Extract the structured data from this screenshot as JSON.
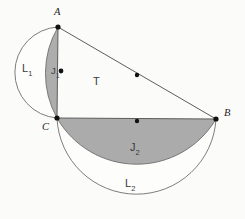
{
  "figure": {
    "background_color": "#fbfbfa",
    "stroke_color": "#6b6b6b",
    "lune_fill_color": "#a8a8a8",
    "point_color": "#111111"
  },
  "points": [
    {
      "id": "A",
      "label": "A",
      "x": 58,
      "y": 27
    },
    {
      "id": "B",
      "label": "B",
      "x": 216,
      "y": 119
    },
    {
      "id": "C",
      "label": "C",
      "x": 57,
      "y": 118
    }
  ],
  "midpoint_dots": [
    {
      "id": "midpoint-ab",
      "x": 137,
      "y": 75
    },
    {
      "id": "midpoint-cb",
      "x": 137,
      "y": 121
    },
    {
      "id": "midpoint-ac-lune",
      "x": 61,
      "y": 71
    }
  ],
  "regions": [
    {
      "id": "lune-upper-outer",
      "label": "L",
      "subscript": "1",
      "x": 22,
      "y": 63
    },
    {
      "id": "lune-upper-inner",
      "label": "J",
      "subscript": "1",
      "x": 51,
      "y": 66
    },
    {
      "id": "triangle",
      "label": "T",
      "subscript": "",
      "x": 93,
      "y": 76
    },
    {
      "id": "lune-lower-inner",
      "label": "J",
      "subscript": "2",
      "x": 130,
      "y": 142
    },
    {
      "id": "lune-lower-outer",
      "label": "L",
      "subscript": "2",
      "x": 125,
      "y": 178
    }
  ],
  "shapes": {
    "triangle_vertices": "A-C-B",
    "semicircle_on_AC": "bulges left, leftmost x 12",
    "semicircle_on_CB": "bulges down, lowest y 200",
    "circumcircle_center_x": 137,
    "circumcircle_center_y": 73,
    "circumcircle_radius": 92
  }
}
